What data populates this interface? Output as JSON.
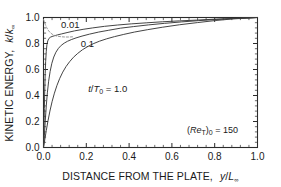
{
  "chart_data": {
    "type": "line",
    "title": "",
    "xlabel": "DISTANCE FROM THE PLATE,  y/L∞",
    "ylabel": "KINETIC ENERGY,  k/k∞",
    "xlim": [
      0.0,
      1.0
    ],
    "ylim": [
      0.0,
      1.0
    ],
    "grid": false,
    "legend_position": "inline-curve-labels",
    "xticks": [
      "0.0",
      "0.2",
      "0.4",
      "0.6",
      "0.8",
      "1.0"
    ],
    "xtick_values": [
      0.0,
      0.2,
      0.4,
      0.6,
      0.8,
      1.0
    ],
    "yticks": [
      "0.0",
      "0.2",
      "0.4",
      "0.6",
      "0.8",
      "1.0"
    ],
    "ytick_values": [
      0.0,
      0.2,
      0.4,
      0.6,
      0.8,
      1.0
    ],
    "minor_ticks_per_interval": 4,
    "annotations": [
      {
        "name": "reynolds-annotation",
        "text": "(Re_T)0 = 150",
        "display": "(Re",
        "display_sub1": "T",
        "display_mid": ")",
        "display_sub2": "0",
        "display_end": " = 150",
        "x": 0.79,
        "y": 0.115
      }
    ],
    "curve_label_prefix": "t/T",
    "curve_label_sub": "0",
    "curve_label_eq": " = 1.0",
    "series": [
      {
        "name": "t/T0 = 0.01",
        "label": "0.01",
        "label_x": 0.125,
        "label_y": 0.945,
        "style": "solid",
        "x": [
          0.0,
          0.002,
          0.004,
          0.006,
          0.008,
          0.01,
          0.013,
          0.016,
          0.02,
          0.025,
          0.032,
          0.04,
          0.05,
          0.065,
          0.085,
          0.11,
          0.145,
          0.185,
          0.23,
          0.285,
          0.345,
          0.41,
          0.48,
          0.555,
          0.635,
          0.715,
          0.8,
          0.885,
          0.945,
          1.0
        ],
        "y": [
          0.0,
          0.13,
          0.3,
          0.45,
          0.57,
          0.66,
          0.74,
          0.79,
          0.82,
          0.838,
          0.848,
          0.854,
          0.859,
          0.866,
          0.874,
          0.884,
          0.897,
          0.909,
          0.92,
          0.932,
          0.942,
          0.951,
          0.959,
          0.967,
          0.974,
          0.98,
          0.987,
          0.993,
          0.996,
          1.0
        ]
      },
      {
        "name": "t/T0 = 0.1",
        "label": "0.1",
        "label_x": 0.205,
        "label_y": 0.8,
        "style": "solid",
        "x": [
          0.0,
          0.004,
          0.008,
          0.013,
          0.018,
          0.024,
          0.031,
          0.039,
          0.048,
          0.058,
          0.07,
          0.083,
          0.097,
          0.112,
          0.13,
          0.152,
          0.18,
          0.215,
          0.258,
          0.305,
          0.36,
          0.42,
          0.49,
          0.565,
          0.645,
          0.725,
          0.81,
          0.89,
          0.948,
          1.0
        ],
        "y": [
          0.0,
          0.09,
          0.2,
          0.32,
          0.42,
          0.51,
          0.585,
          0.648,
          0.696,
          0.733,
          0.763,
          0.786,
          0.803,
          0.817,
          0.83,
          0.843,
          0.857,
          0.872,
          0.888,
          0.902,
          0.918,
          0.93,
          0.943,
          0.955,
          0.966,
          0.976,
          0.985,
          0.992,
          0.996,
          1.0
        ]
      },
      {
        "name": "t/T0 = 1.0",
        "label": "t/T0 = 1.0",
        "label_x": 0.3,
        "label_y": 0.455,
        "style": "solid",
        "x": [
          0.0,
          0.006,
          0.013,
          0.021,
          0.03,
          0.04,
          0.051,
          0.063,
          0.076,
          0.09,
          0.105,
          0.122,
          0.14,
          0.16,
          0.182,
          0.206,
          0.232,
          0.262,
          0.295,
          0.332,
          0.375,
          0.425,
          0.485,
          0.555,
          0.635,
          0.72,
          0.805,
          0.885,
          0.948,
          1.0
        ],
        "y": [
          0.0,
          0.06,
          0.13,
          0.205,
          0.28,
          0.352,
          0.418,
          0.478,
          0.532,
          0.58,
          0.622,
          0.66,
          0.694,
          0.724,
          0.752,
          0.776,
          0.798,
          0.818,
          0.836,
          0.853,
          0.87,
          0.888,
          0.906,
          0.925,
          0.944,
          0.961,
          0.977,
          0.989,
          0.995,
          1.0
        ]
      },
      {
        "name": "reference-dashed",
        "label": "",
        "style": "dashed",
        "x": [
          0.0,
          0.004,
          0.009,
          0.015,
          0.022,
          0.03,
          0.04,
          0.052,
          0.066,
          0.082,
          0.1,
          0.12,
          0.142
        ],
        "y": [
          0.985,
          0.966,
          0.944,
          0.922,
          0.902,
          0.886,
          0.872,
          0.862,
          0.856,
          0.852,
          0.85,
          0.85,
          0.852
        ]
      }
    ]
  },
  "colors": {
    "axis": "#2b2b2b",
    "curve": "#3a3a3a",
    "curve_faint": "#8d8d8d",
    "background": "#ffffff"
  }
}
